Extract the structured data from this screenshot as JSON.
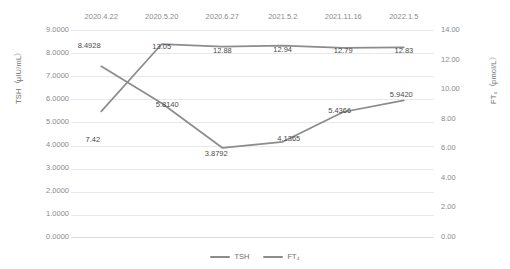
{
  "chart_data": {
    "type": "line",
    "title": "",
    "xlabel": "",
    "categories": [
      "2020.4.22",
      "2020.5.20",
      "2020.6.27",
      "2021.5.2",
      "2021.11.16",
      "2022.1.5"
    ],
    "grid": true,
    "legend_position": "bottom",
    "axes": {
      "left": {
        "label": "TSH（μIU/mL）",
        "series": "TSH",
        "lim": [
          0.0,
          9.0
        ],
        "step": 1.0,
        "ticks": [
          "0.0000",
          "1.0000",
          "2.0000",
          "3.0000",
          "4.0000",
          "5.0000",
          "6.0000",
          "7.0000",
          "8.0000",
          "9.0000"
        ]
      },
      "right": {
        "label": "FT₄（pmol/L）",
        "series": "FT4",
        "lim": [
          0.0,
          14.0
        ],
        "step": 2.0,
        "ticks": [
          "0.00",
          "2.00",
          "4.00",
          "6.00",
          "8.00",
          "10.00",
          "12.00",
          "14.00"
        ]
      }
    },
    "series": [
      {
        "name": "TSH",
        "axis": "left",
        "color": "#8c8c8c",
        "values": [
          7.42,
          5.814,
          3.8792,
          4.1365,
          5.4366,
          5.942
        ],
        "labels": [
          "7.42",
          "5.8140",
          "3.8792",
          "4.1365",
          "5.4366",
          "5.9420"
        ]
      },
      {
        "name": "FT4",
        "axis": "right",
        "color": "#8c8c8c",
        "values": [
          8.4928,
          13.05,
          12.88,
          12.94,
          12.79,
          12.83
        ],
        "labels": [
          "8.4928",
          "13.05",
          "12.88",
          "12.94",
          "12.79",
          "12.83"
        ]
      }
    ],
    "legend": [
      "TSH",
      "FT₄"
    ]
  }
}
